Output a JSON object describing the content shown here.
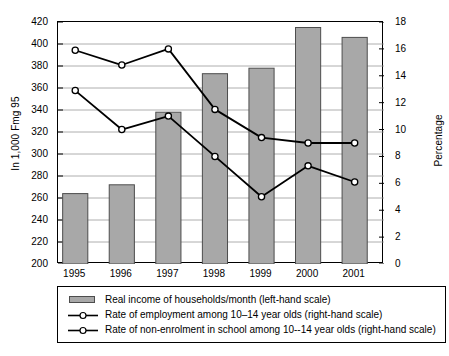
{
  "chart_data": {
    "type": "bar",
    "title": "",
    "categories": [
      "1995",
      "1996",
      "1997",
      "1998",
      "1999",
      "2000",
      "2001"
    ],
    "ylabel": "In 1,000 Fmg 95",
    "ylabel_right": "Percentage",
    "xlabel": "",
    "ylim": [
      200,
      420
    ],
    "ylim_right": [
      0,
      18
    ],
    "y_ticks": [
      200,
      220,
      240,
      260,
      280,
      300,
      320,
      340,
      360,
      380,
      400,
      420
    ],
    "y_ticks_right": [
      0,
      2,
      4,
      6,
      8,
      10,
      12,
      14,
      16,
      18
    ],
    "grid": true,
    "legend_position": "below",
    "series": [
      {
        "name": "Real income of households/month (left-hand scale)",
        "type": "bar",
        "axis": "left",
        "color": "#a8a8a8",
        "edge_color": "#4d4d4d",
        "values": [
          264,
          272,
          338,
          373,
          378,
          415,
          406
        ]
      },
      {
        "name": "Rate of employment among 10–14 year olds (right-hand scale)",
        "type": "line",
        "axis": "right",
        "color": "#000000",
        "marker": "open-circle",
        "values": [
          12.9,
          10.0,
          11.0,
          8.0,
          5.0,
          7.3,
          6.1
        ]
      },
      {
        "name": "Rate of non-enrolment in school among 10--14 year olds (right-hand scale)",
        "type": "line",
        "axis": "right",
        "color": "#000000",
        "marker": "open-circle",
        "values": [
          15.9,
          14.8,
          16.0,
          11.5,
          9.4,
          9.0,
          9.0
        ]
      }
    ]
  },
  "axes": {
    "left_title": "In 1,000 Fmg 95",
    "right_title": "Percentage"
  },
  "legend": {
    "items": [
      {
        "key": "bar-swatch",
        "label": "Real income of households/month (left-hand scale)"
      },
      {
        "key": "line-marker",
        "label": "Rate of employment among 10–14 year olds (right-hand scale)"
      },
      {
        "key": "line-marker",
        "label": "Rate of non-enrolment in school among 10--14 year olds (right-hand scale)"
      }
    ]
  }
}
